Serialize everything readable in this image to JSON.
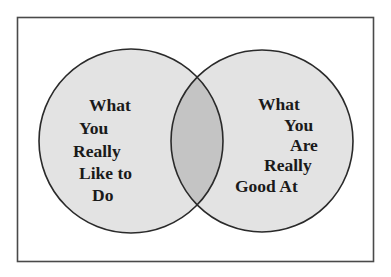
{
  "diagram": {
    "type": "venn",
    "colors": {
      "background": "#ffffff",
      "frame_stroke": "#4a4a4a",
      "circle_fill": "#e3e3e3",
      "circle_stroke": "#2a2a2a",
      "overlap_fill": "#c4c4c4",
      "text": "#1a1a1a"
    },
    "left_circle": {
      "label_lines": [
        "What",
        "You",
        "Really",
        "Like to",
        "Do"
      ]
    },
    "right_circle": {
      "label_lines": [
        "What",
        "You",
        "Are",
        "Really",
        "Good At"
      ]
    },
    "overlap": {
      "label": ""
    }
  }
}
